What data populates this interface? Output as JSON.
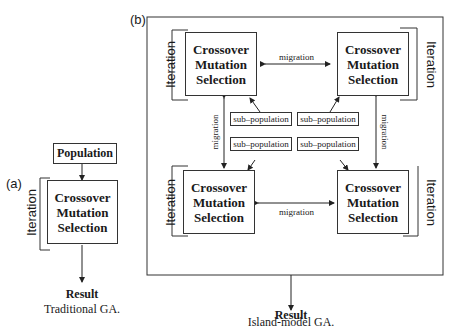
{
  "panel_a": {
    "label": "(a)",
    "population": "Population",
    "ops": [
      "Crossover",
      "Mutation",
      "Selection"
    ],
    "iteration": "Iteration",
    "result": "Result",
    "caption": "Traditional GA."
  },
  "panel_b": {
    "label": "(b)",
    "islands": [
      {
        "ops": [
          "Crossover",
          "Mutation",
          "Selection"
        ],
        "iteration": "Iteration"
      },
      {
        "ops": [
          "Crossover",
          "Mutation",
          "Selection"
        ],
        "iteration": "Iteration"
      },
      {
        "ops": [
          "Crossover",
          "Mutation",
          "Selection"
        ],
        "iteration": "Iteration"
      },
      {
        "ops": [
          "Crossover",
          "Mutation",
          "Selection"
        ],
        "iteration": "Iteration"
      }
    ],
    "subpopulations": [
      "sub–population",
      "sub–population",
      "sub–population",
      "sub–population"
    ],
    "migration": "migration",
    "result": "Result",
    "caption": "Island-model GA."
  }
}
